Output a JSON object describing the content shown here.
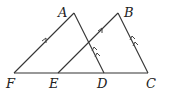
{
  "diagram": {
    "type": "geometry",
    "points": {
      "A": {
        "label": "A",
        "x": 74,
        "y": 13
      },
      "B": {
        "label": "B",
        "x": 118,
        "y": 13
      },
      "F": {
        "label": "F",
        "x": 14,
        "y": 73
      },
      "E": {
        "label": "E",
        "x": 58,
        "y": 73
      },
      "D": {
        "label": "D",
        "x": 104,
        "y": 73
      },
      "C": {
        "label": "C",
        "x": 148,
        "y": 73
      }
    },
    "segments": [
      {
        "from": "F",
        "to": "C",
        "marks": 0
      },
      {
        "from": "F",
        "to": "A",
        "marks": 1
      },
      {
        "from": "A",
        "to": "D",
        "marks": 2
      },
      {
        "from": "E",
        "to": "B",
        "marks": 1
      },
      {
        "from": "B",
        "to": "C",
        "marks": 2
      }
    ],
    "parallel_pairs": [
      [
        "FA",
        "EB"
      ],
      [
        "AD",
        "BC"
      ]
    ],
    "labels": {
      "A": "A",
      "B": "B",
      "C": "C",
      "D": "D",
      "E": "E",
      "F": "F"
    }
  }
}
